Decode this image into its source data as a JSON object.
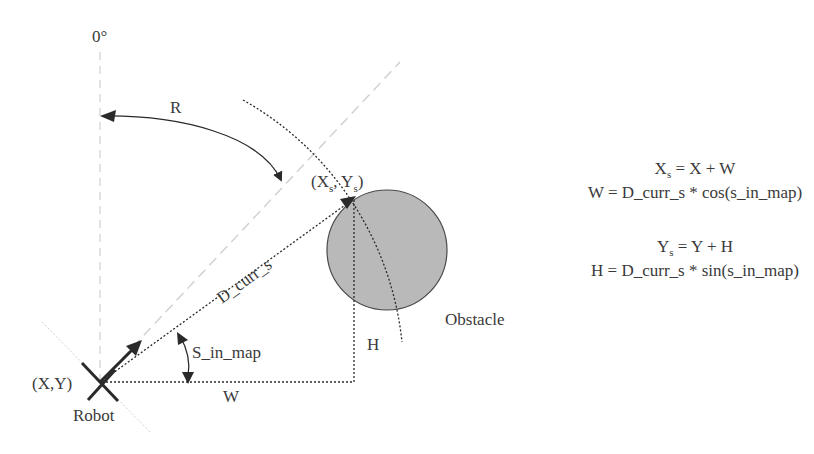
{
  "diagram": {
    "type": "robot-obstacle-geometry",
    "labels": {
      "zero_angle": "0°",
      "rotation": "R",
      "sensor_point_open": "(X",
      "sensor_point_sub1": "s",
      "sensor_point_mid": ", Y",
      "sensor_point_sub2": "s",
      "sensor_point_close": ")",
      "distance": "D_curr_s",
      "angle": "S_in_map",
      "robot_position": "(X,Y)",
      "robot": "Robot",
      "width": "W",
      "height": "H",
      "obstacle": "Obstacle"
    },
    "formulas": [
      {
        "lhs": "X",
        "sub": "s",
        "rhs": " = X + W"
      },
      {
        "text": "W = D_curr_s * cos(s_in_map)"
      },
      {
        "lhs": "Y",
        "sub": "s",
        "rhs": " = Y + H"
      },
      {
        "text": "H = D_curr_s * sin(s_in_map)"
      }
    ],
    "colors": {
      "stroke": "#2a2a2a",
      "dashed_guide": "#cfcfcf",
      "obstacle_fill": "#b9b9b9",
      "obstacle_stroke": "#4a4a4a",
      "text": "#3a3a3a"
    }
  }
}
